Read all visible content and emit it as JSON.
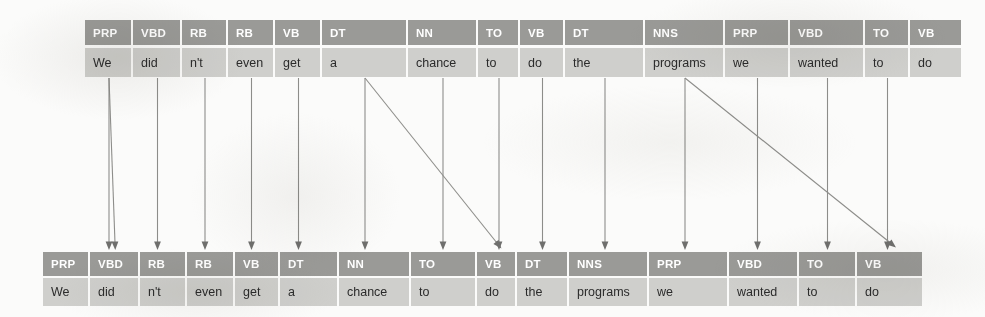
{
  "figure": {
    "name": "pos-tag-alignment-diagram",
    "colors": {
      "tag_band": "#9a9a97",
      "token_band": "#cfcfcc",
      "tag_text": "#ffffff",
      "token_text": "#2b2b2b",
      "arrow": "#8d8d8a",
      "background": "#fbfbfa"
    }
  },
  "sentence": "We did n't even get a chance to do the programs we wanted to do",
  "top_row": {
    "name": "source-sequence",
    "left": 85,
    "top": 20,
    "tokens": [
      {
        "tag": "PRP",
        "word": "We",
        "width": 48
      },
      {
        "tag": "VBD",
        "word": "did",
        "width": 49
      },
      {
        "tag": "RB",
        "word": "n't",
        "width": 46
      },
      {
        "tag": "RB",
        "word": "even",
        "width": 47
      },
      {
        "tag": "VB",
        "word": "get",
        "width": 47
      },
      {
        "tag": "DT",
        "word": "a",
        "width": 86
      },
      {
        "tag": "NN",
        "word": "chance",
        "width": 70
      },
      {
        "tag": "TO",
        "word": "to",
        "width": 42
      },
      {
        "tag": "VB",
        "word": "do",
        "width": 45
      },
      {
        "tag": "DT",
        "word": "the",
        "width": 80
      },
      {
        "tag": "NNS",
        "word": "programs",
        "width": 80
      },
      {
        "tag": "PRP",
        "word": "we",
        "width": 65
      },
      {
        "tag": "VBD",
        "word": "wanted",
        "width": 75
      },
      {
        "tag": "TO",
        "word": "to",
        "width": 45
      },
      {
        "tag": "VB",
        "word": "do",
        "width": 53
      }
    ]
  },
  "bottom_row": {
    "name": "target-sequence",
    "left": 43,
    "top": 252,
    "tokens": [
      {
        "tag": "PRP",
        "word": "We",
        "width": 47
      },
      {
        "tag": "VBD",
        "word": "did",
        "width": 50
      },
      {
        "tag": "RB",
        "word": "n't",
        "width": 47
      },
      {
        "tag": "RB",
        "word": "even",
        "width": 48
      },
      {
        "tag": "VB",
        "word": "get",
        "width": 45
      },
      {
        "tag": "DT",
        "word": "a",
        "width": 59
      },
      {
        "tag": "NN",
        "word": "chance",
        "width": 72
      },
      {
        "tag": "TO",
        "word": "to",
        "width": 66
      },
      {
        "tag": "VB",
        "word": "do",
        "width": 40
      },
      {
        "tag": "DT",
        "word": "the",
        "width": 52
      },
      {
        "tag": "NNS",
        "word": "programs",
        "width": 80
      },
      {
        "tag": "PRP",
        "word": "we",
        "width": 80
      },
      {
        "tag": "VBD",
        "word": "wanted",
        "width": 70
      },
      {
        "tag": "TO",
        "word": "to",
        "width": 58
      },
      {
        "tag": "VB",
        "word": "do",
        "width": 67
      }
    ]
  },
  "links": {
    "name": "alignment-arrows",
    "note": "source index -> target index; straight = vertical drop, diagonal = shifted alignment",
    "edges": [
      {
        "from": 0,
        "to": 1,
        "kind": "diagonal"
      },
      {
        "from": 0,
        "to": 1,
        "kind": "straight"
      },
      {
        "from": 1,
        "to": 2,
        "kind": "straight"
      },
      {
        "from": 2,
        "to": 3,
        "kind": "straight"
      },
      {
        "from": 3,
        "to": 3,
        "kind": "straight"
      },
      {
        "from": 4,
        "to": 4,
        "kind": "straight"
      },
      {
        "from": 5,
        "to": 8,
        "kind": "diagonal"
      },
      {
        "from": 5,
        "to": 6,
        "kind": "straight"
      },
      {
        "from": 6,
        "to": 7,
        "kind": "straight"
      },
      {
        "from": 7,
        "to": 8,
        "kind": "straight"
      },
      {
        "from": 8,
        "to": 9,
        "kind": "straight"
      },
      {
        "from": 9,
        "to": 10,
        "kind": "straight"
      },
      {
        "from": 10,
        "to": 14,
        "kind": "diagonal"
      },
      {
        "from": 10,
        "to": 11,
        "kind": "straight"
      },
      {
        "from": 11,
        "to": 12,
        "kind": "straight"
      },
      {
        "from": 12,
        "to": 13,
        "kind": "straight"
      },
      {
        "from": 13,
        "to": 14,
        "kind": "straight"
      }
    ]
  }
}
